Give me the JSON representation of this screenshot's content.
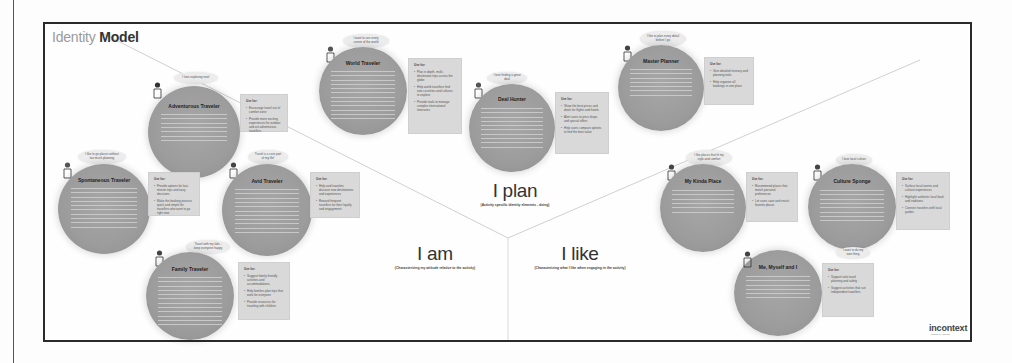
{
  "title": {
    "light": "Identity",
    "bold": "Model"
  },
  "sections": {
    "plan": {
      "label": "I plan",
      "subtitle": "(Activity specific identity elements - doing)"
    },
    "am": {
      "label": "I am",
      "subtitle": "(Characterizing my attitude relative to the activity)"
    },
    "like": {
      "label": "I like",
      "subtitle": "(Characterizing what I like when engaging in the activity)"
    }
  },
  "personas": [
    {
      "id": "adventurous-traveler",
      "name": "Adventurous Traveler",
      "section": "I am",
      "quote": "I love exploring new!",
      "use_for_title": "Use for:",
      "use_for": [
        "Encourage travel out of comfort zone",
        "Provide more exciting experiences for outdoor and out adventurous travellers"
      ]
    },
    {
      "id": "spontaneous-traveler",
      "name": "Spontaneous Traveler",
      "section": "I am",
      "quote": "I like to go places without too much planning",
      "use_for_title": "Use for:",
      "use_for": [
        "Provide options for last-minute trips and easy decisions",
        "Make the booking process quick and simple for travellers who want to go right now"
      ]
    },
    {
      "id": "avid-traveler",
      "name": "Avid Traveler",
      "section": "I am",
      "quote": "Travel is a core part of my life!",
      "use_for_title": "Use for:",
      "use_for": [
        "Help avid travelers discover new destinations and experiences",
        "Reward frequent travellers for their loyalty and engagement"
      ]
    },
    {
      "id": "family-traveler",
      "name": "Family Traveler",
      "section": "I am",
      "quote": "Travel with my kids - keep everyone happy",
      "use_for_title": "Use for:",
      "use_for": [
        "Suggest family-friendly activities and accommodations",
        "Help families plan trips that work for everyone",
        "Provide resources for traveling with children"
      ]
    },
    {
      "id": "world-traveler",
      "name": "World Traveler",
      "section": "I plan",
      "quote": "I want to see every corner of the world",
      "use_for_title": "Use for:",
      "use_for": [
        "Plan in depth, multi-destination trips across the globe",
        "Help world travellers find new countries and cultures to explore",
        "Provide tools to manage complex international itineraries"
      ]
    },
    {
      "id": "deal-hunter",
      "name": "Deal Hunter",
      "section": "I plan",
      "quote": "I love finding a great deal",
      "use_for_title": "Use for:",
      "use_for": [
        "Show the best prices and deals for flights and hotels",
        "Alert users to price drops and special offers",
        "Help users compare options to find the best value"
      ]
    },
    {
      "id": "master-planner",
      "name": "Master Planner",
      "section": "I plan",
      "quote": "I like to plan every detail before I go",
      "use_for_title": "Use for:",
      "use_for": [
        "Give detailed itinerary and planning tools",
        "Help organize all bookings in one place"
      ]
    },
    {
      "id": "my-kinda-place",
      "name": "My Kinda Place",
      "section": "I like",
      "quote": "I like places that fit my style and comfort",
      "use_for_title": "Use for:",
      "use_for": [
        "Recommend places that match personal preferences",
        "Let users save and revisit favorite places"
      ]
    },
    {
      "id": "culture-sponge",
      "name": "Culture Sponge",
      "section": "I like",
      "quote": "I love local culture",
      "use_for_title": "Use for:",
      "use_for": [
        "Surface local events and cultural experiences",
        "Highlight authentic local food and traditions",
        "Connect travelers with local guides"
      ]
    },
    {
      "id": "me-myself-and-i",
      "name": "Me, Myself and I",
      "section": "I like",
      "quote": "I want to do my own thing",
      "use_for_title": "Use for:",
      "use_for": [
        "Support solo travel planning and safety",
        "Suggest activities that suit independent travellers"
      ]
    }
  ],
  "logo": {
    "text": "incontext",
    "tagline": "design by insight"
  },
  "colors": {
    "circle": "#9c9c9c",
    "use_for_box": "#d9d9d9",
    "frame": "#2a2a2a",
    "title_light": "#9a9a9a"
  }
}
